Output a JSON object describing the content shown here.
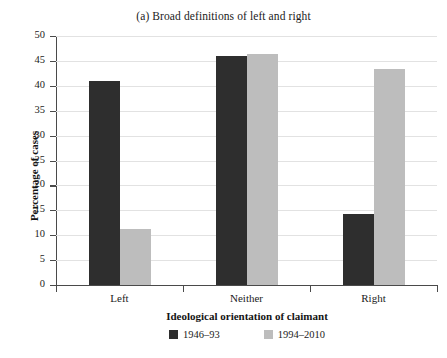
{
  "chart_data": {
    "type": "bar",
    "title": "(a) Broad definitions of left and right",
    "xlabel": "Ideological orientation of claimant",
    "ylabel": "Percentage of cases",
    "categories": [
      "Left",
      "Neither",
      "Right"
    ],
    "series": [
      {
        "name": "1946–93",
        "color": "#2e2e2e",
        "values": [
          41.0,
          46.0,
          14.3
        ]
      },
      {
        "name": "1994–2010",
        "color": "#bdbdbd",
        "values": [
          11.3,
          46.3,
          43.3
        ]
      }
    ],
    "ylim": [
      0,
      50
    ],
    "yticks": [
      0,
      5,
      10,
      15,
      20,
      25,
      30,
      35,
      40,
      45,
      50
    ],
    "ytick_labels": [
      "0",
      "5",
      "10",
      "15",
      "20",
      "25",
      "30",
      "35",
      "40",
      "45",
      "50"
    ],
    "grid": true,
    "grid_axis": "y",
    "legend_position": "bottom-center"
  }
}
